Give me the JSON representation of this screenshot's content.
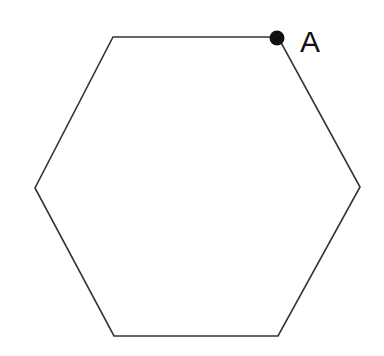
{
  "figure": {
    "kind": "geometry-diagram",
    "background_color": "#ffffff",
    "canvas": {
      "width": 384,
      "height": 356
    },
    "shape": {
      "name": "hexagon",
      "sides": 6,
      "stroke_color": "#333333",
      "stroke_width": 1.6,
      "fill_color": "none",
      "vertices": [
        {
          "id": "v1",
          "x": 113,
          "y": 37,
          "label": "A",
          "marked": true
        },
        {
          "id": "v2",
          "x": 360,
          "y": 187,
          "label": "",
          "marked": false
        },
        {
          "id": "v3",
          "x": 278,
          "y": 336,
          "label": "",
          "marked": false
        },
        {
          "id": "v4",
          "x": 114,
          "y": 336,
          "label": "",
          "marked": false
        },
        {
          "id": "v5",
          "x": 35,
          "y": 188,
          "label": "",
          "marked": false
        },
        {
          "id": "v6",
          "x": 278,
          "y": 37,
          "label": "A",
          "marked": true
        }
      ],
      "path_points": "113,37 278,37 360,187 278,336 114,336 35,188"
    },
    "marked_point": {
      "name": "point-a",
      "label": "A",
      "x": 277,
      "y": 38,
      "radius": 7.5,
      "color": "#111111"
    },
    "labels": [
      {
        "name": "vertex-label-a",
        "text": "A",
        "x": 300,
        "y": 52,
        "font_size": 30,
        "color": "#111111"
      }
    ]
  }
}
